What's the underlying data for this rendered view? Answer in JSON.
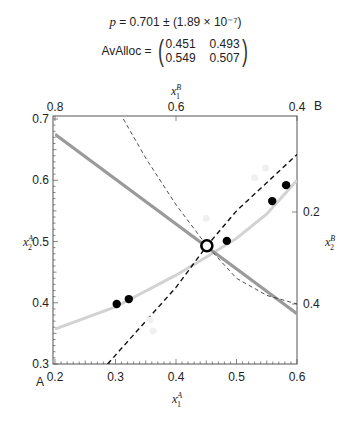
{
  "header": {
    "p_label": "p",
    "p_value": "= 0.701 ± (1.89 × 10⁻⁷)",
    "avalloc_label": "AvAlloc =",
    "matrix": [
      [
        "0.451",
        "0.493"
      ],
      [
        "0.549",
        "0.507"
      ]
    ]
  },
  "chart_data": {
    "type": "scatter",
    "title": "",
    "xlabel": "x1^A",
    "ylabel": "x2^A",
    "top_xlabel": "x1^B",
    "right_ylabel": "x2^B",
    "corner_labels": {
      "bottom_left": "A",
      "top_right": "B"
    },
    "xlim": [
      0.2,
      0.6
    ],
    "ylim": [
      0.3,
      0.7
    ],
    "x_ticks": [
      "0.2",
      "0.3",
      "0.4",
      "0.5",
      "0.6"
    ],
    "y_ticks": [
      "0.3",
      "0.4",
      "0.5",
      "0.6",
      "0.7"
    ],
    "top_ticks": [
      "0.8",
      "0.6",
      "0.4"
    ],
    "right_ticks": [
      "0.2",
      "0.4"
    ],
    "grid": false,
    "series": [
      {
        "name": "allocations",
        "marker": "filled-circle",
        "points": [
          [
            0.302,
            0.398
          ],
          [
            0.322,
            0.406
          ],
          [
            0.484,
            0.501
          ],
          [
            0.559,
            0.566
          ],
          [
            0.582,
            0.592
          ]
        ]
      },
      {
        "name": "average allocation",
        "marker": "open-circle",
        "points": [
          [
            0.451,
            0.493
          ]
        ]
      },
      {
        "name": "faint points",
        "marker": "faint-circle",
        "points": [
          [
            0.357,
            0.372
          ],
          [
            0.362,
            0.354
          ],
          [
            0.45,
            0.538
          ],
          [
            0.53,
            0.604
          ],
          [
            0.548,
            0.62
          ]
        ]
      },
      {
        "name": "contract curve",
        "style": "light-gray-solid",
        "points": [
          [
            0.2,
            0.357
          ],
          [
            0.3,
            0.393
          ],
          [
            0.4,
            0.445
          ],
          [
            0.451,
            0.475
          ],
          [
            0.5,
            0.505
          ],
          [
            0.55,
            0.545
          ],
          [
            0.6,
            0.6
          ]
        ]
      },
      {
        "name": "budget line",
        "style": "gray-solid-thick",
        "points": [
          [
            0.2,
            0.675
          ],
          [
            0.6,
            0.382
          ]
        ]
      },
      {
        "name": "offer curve A",
        "style": "black-dashed",
        "points": [
          [
            0.287,
            0.3
          ],
          [
            0.35,
            0.37
          ],
          [
            0.4,
            0.425
          ],
          [
            0.451,
            0.493
          ],
          [
            0.5,
            0.55
          ],
          [
            0.6,
            0.642
          ]
        ]
      },
      {
        "name": "offer curve B",
        "style": "thin-dashed",
        "points": [
          [
            0.313,
            0.7
          ],
          [
            0.35,
            0.636
          ],
          [
            0.4,
            0.56
          ],
          [
            0.451,
            0.493
          ],
          [
            0.5,
            0.44
          ],
          [
            0.55,
            0.412
          ],
          [
            0.6,
            0.398
          ]
        ]
      }
    ]
  }
}
